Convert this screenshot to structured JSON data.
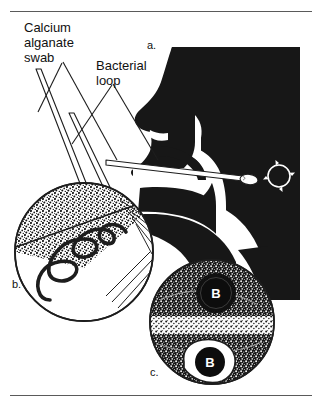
{
  "figure": {
    "background_color": "#ffffff",
    "ink_color": "#111111",
    "rules": {
      "top_label": "top-divider-rule",
      "bottom_label": "bottom-divider-rule"
    },
    "labels": {
      "swab": "Calcium\nalganate\nswab",
      "loop": "Bacterial\nloop"
    },
    "panels": [
      {
        "id": "a",
        "letter": "a.",
        "description": "Lateral head and neck silhouette with swab inserted through the mouth toward the pharynx; circular rotation arrow marker at the posterior pharyngeal wall"
      },
      {
        "id": "b",
        "letter": "b.",
        "description": "Agar plate: swab inoculation of a stippled primary zone followed by zig-zag streaking with the bacterial loop"
      },
      {
        "id": "c",
        "letter": "c.",
        "description": "Culture plate showing dense stippled bacterial growth with two dark colonies each marked B"
      }
    ],
    "colony_marker": "B",
    "colony_count": 2
  }
}
